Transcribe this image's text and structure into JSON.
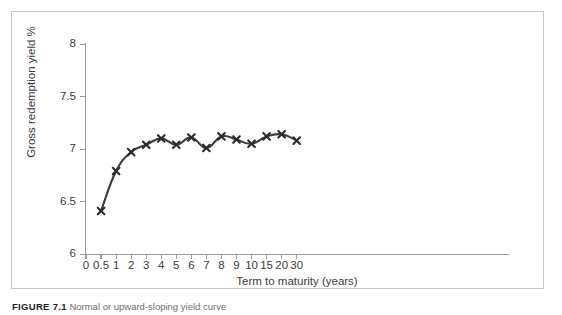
{
  "figure": {
    "caption_number": "FIGURE 7.1",
    "caption_text": "Normal or upward-sloping yield curve"
  },
  "chart_data": {
    "type": "line",
    "title": "",
    "xlabel": "Term to maturity (years)",
    "ylabel": "Gross redemption yield %",
    "x": [
      0.5,
      1,
      2,
      3,
      4,
      5,
      6,
      7,
      8,
      9,
      10,
      15,
      20,
      30
    ],
    "values": [
      6.41,
      6.79,
      6.97,
      7.04,
      7.1,
      7.04,
      7.11,
      7.01,
      7.12,
      7.09,
      7.05,
      7.12,
      7.14,
      7.08
    ],
    "series": [
      {
        "name": "Gross redemption yield",
        "values": [
          6.41,
          6.79,
          6.97,
          7.04,
          7.1,
          7.04,
          7.11,
          7.01,
          7.12,
          7.09,
          7.05,
          7.12,
          7.14,
          7.08
        ]
      }
    ],
    "ylim": [
      6,
      8
    ],
    "y_ticks": [
      6,
      6.5,
      7,
      7.5,
      8
    ],
    "y_tick_labels": [
      "6",
      "6.5",
      "7",
      "7.5",
      "8"
    ],
    "x_tick_labels": [
      "0",
      "0.5",
      "1",
      "2",
      "3",
      "4",
      "5",
      "6",
      "7",
      "8",
      "9",
      "10",
      "15",
      "20",
      "30"
    ],
    "x_tick_values": [
      0,
      0.5,
      1,
      2,
      3,
      4,
      5,
      6,
      7,
      8,
      9,
      10,
      15,
      20,
      30
    ],
    "grid": false,
    "legend": false,
    "marker": "x",
    "line_color": "#3b3b3b",
    "marker_color": "#2a2a2a",
    "axis_color": "#9a9a9a"
  }
}
